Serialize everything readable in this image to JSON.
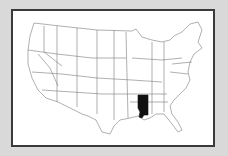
{
  "map": {
    "title": "",
    "region": "United States",
    "highlighted_state": "Mississippi",
    "colors": {
      "background": "#d9d9d9",
      "frame_border": "#3a3a3a",
      "state_fill": "#ffffff",
      "state_stroke": "#7a7a7a",
      "highlight_fill": "#111111"
    }
  }
}
